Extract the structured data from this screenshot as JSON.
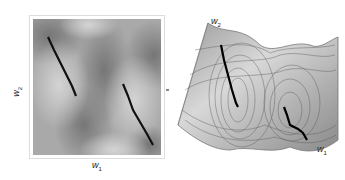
{
  "figure": {
    "left_panel": {
      "type": "2d-heatmap",
      "xlabel": "w",
      "xlabel_sub": "1",
      "ylabel": "w",
      "ylabel_sub": "2",
      "colors": {
        "light": "#c8c8c8",
        "dark": "#7a7a7a",
        "frame": "#dddddd",
        "path": "#111111"
      },
      "trajectories": [
        {
          "name": "path-1",
          "points": [
            [
              48,
              37
            ],
            [
              54,
              50
            ],
            [
              60,
              62
            ],
            [
              66,
              74
            ],
            [
              72,
              86
            ],
            [
              76,
              96
            ]
          ]
        },
        {
          "name": "path-2",
          "points": [
            [
              123,
              84
            ],
            [
              128,
              96
            ],
            [
              133,
              110
            ],
            [
              140,
              122
            ],
            [
              147,
              134
            ],
            [
              153,
              145
            ]
          ]
        }
      ]
    },
    "right_panel": {
      "type": "3d-surface-contour",
      "axis_w1_label": "w",
      "axis_w1_sub": "1",
      "axis_w2_label": "w",
      "axis_w2_sub": "2",
      "colors": {
        "surface": "#b9b9b9",
        "contour": "#555555",
        "path": "#000000"
      }
    }
  }
}
